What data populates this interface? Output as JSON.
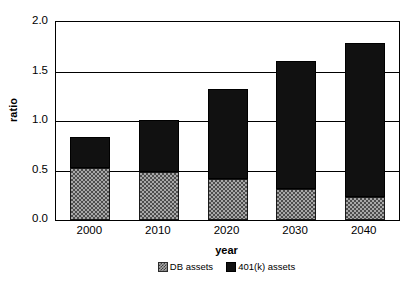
{
  "chart_data": {
    "type": "bar",
    "subtype": "stacked-bar",
    "title": "",
    "xlabel": "year",
    "ylabel": "ratio",
    "categories": [
      "2000",
      "2010",
      "2020",
      "2030",
      "2040"
    ],
    "series": [
      {
        "name": "DB assets",
        "values": [
          0.53,
          0.49,
          0.41,
          0.31,
          0.23
        ],
        "color": "#a8a8a8",
        "pattern": "checkered"
      },
      {
        "name": "401(k) assets",
        "values": [
          0.31,
          0.52,
          0.91,
          1.3,
          1.56
        ],
        "color": "#111111",
        "pattern": "solid"
      }
    ],
    "totals": [
      0.84,
      1.01,
      1.32,
      1.61,
      1.79
    ],
    "ylim": [
      0.0,
      2.0
    ],
    "yticks": [
      "0.0",
      "0.5",
      "1.0",
      "1.5",
      "2.0"
    ],
    "ytick_values": [
      0.0,
      0.5,
      1.0,
      1.5,
      2.0
    ],
    "grid": true,
    "grid_axis": "y",
    "legend_position": "bottom-center",
    "legend_entries": [
      "DB assets",
      "401(k) assets"
    ]
  },
  "axes": {
    "y_title": "ratio",
    "x_title": "year"
  },
  "legend": {
    "items": [
      {
        "label": "DB assets",
        "swatch": "db-assets-swatch-icon"
      },
      {
        "label": "401(k) assets",
        "swatch": "401k-assets-swatch-icon"
      }
    ]
  }
}
